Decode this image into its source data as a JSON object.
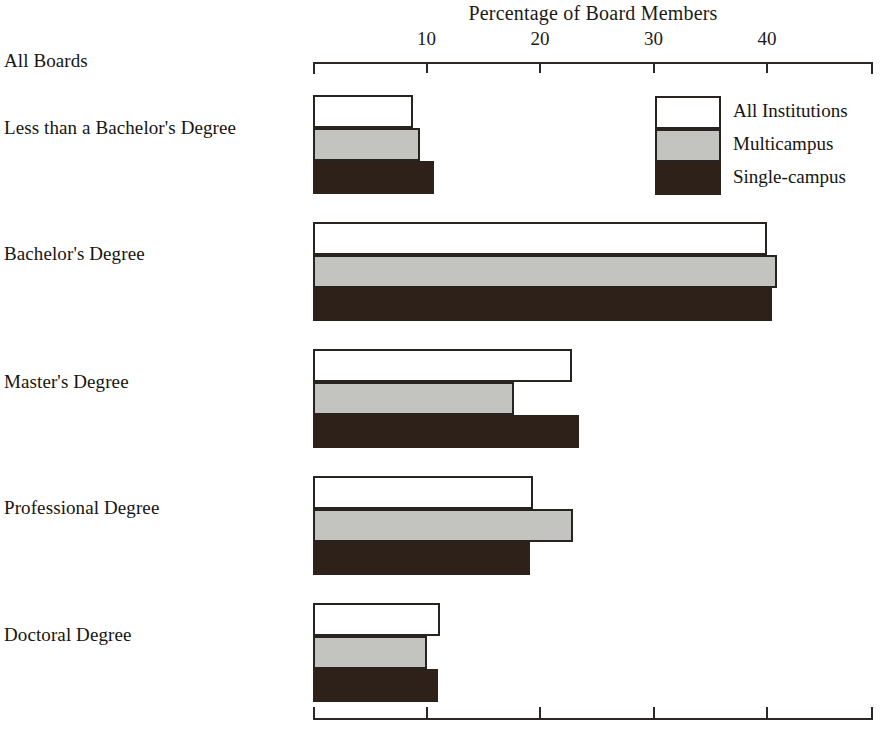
{
  "chart_data": {
    "type": "bar",
    "orientation": "horizontal",
    "title": "Percentage of Board Members",
    "xlabel": "Percentage of Board Members",
    "ylabel": "",
    "group_header": "All Boards",
    "categories": [
      "Less than a Bachelor's Degree",
      "Bachelor's Degree",
      "Master's Degree",
      "Professional Degree",
      "Doctoral Degree"
    ],
    "series": [
      {
        "name": "All Institutions",
        "color": "#ffffff",
        "values": [
          8.8,
          40.0,
          22.8,
          19.4,
          11.2
        ]
      },
      {
        "name": "Multicampus",
        "color": "#c3c3c0",
        "values": [
          9.4,
          40.9,
          17.7,
          22.9,
          10.0
        ]
      },
      {
        "name": "Single-campus",
        "color": "#2e2119",
        "values": [
          10.7,
          40.4,
          23.4,
          19.1,
          11.0
        ]
      }
    ],
    "xticks": [
      10,
      20,
      30,
      40
    ],
    "xtick_labels": [
      "10",
      "20",
      "30",
      "40"
    ],
    "xlim": [
      0,
      49.3
    ],
    "grid": false,
    "legend_position": "top-right",
    "axis_style": "top-and-bottom-rules-with-ticks"
  },
  "legend": {
    "entries": [
      {
        "label": "All Institutions"
      },
      {
        "label": "Multicampus"
      },
      {
        "label": "Single-campus"
      }
    ]
  }
}
